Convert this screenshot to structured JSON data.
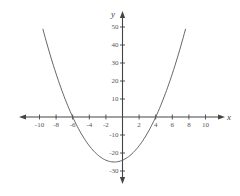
{
  "chart_data": {
    "type": "line",
    "title": "",
    "xlabel": "x",
    "ylabel": "y",
    "xlim": [
      -12,
      12
    ],
    "ylim": [
      -37,
      55
    ],
    "grid": false,
    "legend": null,
    "x_ticks": [
      -10,
      -8,
      -6,
      -4,
      -2,
      2,
      4,
      6,
      8,
      10
    ],
    "x_tick_labels": [
      "-10",
      "-8",
      "-6",
      "-4",
      "-2",
      "2",
      "4",
      "6",
      "8",
      "10"
    ],
    "y_ticks": [
      50,
      40,
      30,
      20,
      10,
      -10,
      -20,
      -30
    ],
    "y_tick_labels": [
      "50",
      "40",
      "30",
      "20",
      "10",
      "-10",
      "-20",
      "-30"
    ],
    "series": [
      {
        "name": "parabola",
        "equation": "y = x^2 + 2x - 24",
        "x_intercepts": [
          -6,
          4
        ],
        "vertex": [
          -1,
          -25
        ],
        "y_intercept": -24,
        "x": [
          -9.6,
          -9,
          -8,
          -7,
          -6,
          -5,
          -4,
          -3,
          -2,
          -1,
          0,
          1,
          2,
          3,
          4,
          5,
          6,
          7,
          7.6
        ],
        "values": [
          49.0,
          39,
          24,
          11,
          0,
          -9,
          -16,
          -21,
          -24,
          -25,
          -24,
          -21,
          -16,
          -9,
          0,
          11,
          24,
          39,
          48.96
        ]
      }
    ],
    "colors": {
      "axis": "#444444",
      "curve": "#555555"
    }
  }
}
